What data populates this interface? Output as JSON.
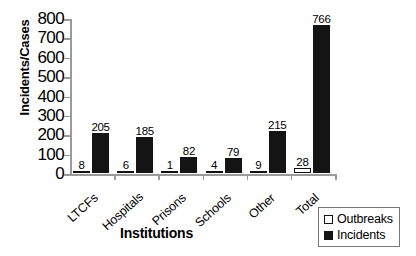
{
  "chart_data": {
    "type": "bar",
    "title": "",
    "xlabel": "Institutions",
    "ylabel": "Incidents/Cases",
    "categories": [
      "LTCFs",
      "Hospitals",
      "Prisons",
      "Schools",
      "Other",
      "Total"
    ],
    "series": [
      {
        "name": "Outbreaks",
        "values": [
          8,
          6,
          1,
          4,
          9,
          28
        ],
        "color": "#ffffff"
      },
      {
        "name": "Incidents",
        "values": [
          205,
          185,
          82,
          79,
          215,
          766
        ],
        "color": "#141414"
      }
    ],
    "ylim": [
      0,
      800
    ],
    "yticks": [
      0,
      100,
      200,
      300,
      400,
      500,
      600,
      700,
      800
    ],
    "ytick_labels": [
      "0",
      "100",
      "200",
      "300",
      "400",
      "500",
      "600",
      "700",
      "800"
    ],
    "grid": false,
    "legend_position": "bottom-right",
    "data_labels": {
      "outbreaks": [
        "8",
        "6",
        "1",
        "4",
        "9",
        "28"
      ],
      "incidents": [
        "205",
        "185",
        "82",
        "79",
        "215",
        "766"
      ]
    },
    "axis_color": "#9a9a9a"
  },
  "legend": {
    "entries": [
      {
        "label": "Outbreaks",
        "swatch": "hollow-square"
      },
      {
        "label": "Incidents",
        "swatch": "filled-square"
      }
    ]
  }
}
